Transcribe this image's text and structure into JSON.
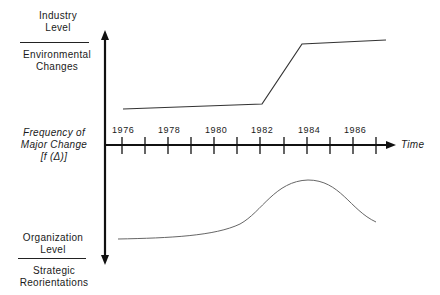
{
  "labels": {
    "top_upper": "Industry Level",
    "top_upper_l1": "Industry",
    "top_upper_l2": "Level",
    "top_lower_l1": "Environmental",
    "top_lower_l2": "Changes",
    "mid_l1": "Frequency of",
    "mid_l2": "Major Change",
    "mid_l3": "[f (Δ)]",
    "bot_upper_l1": "Organization",
    "bot_upper_l2": "Level",
    "bot_lower_l1": "Strategic",
    "bot_lower_l2": "Reorientations",
    "time_axis": "Time"
  },
  "years": [
    "1976",
    "1978",
    "1980",
    "1982",
    "1984",
    "1986"
  ],
  "colors": {
    "ink": "#1a1a1a",
    "curve": "#555555"
  }
}
